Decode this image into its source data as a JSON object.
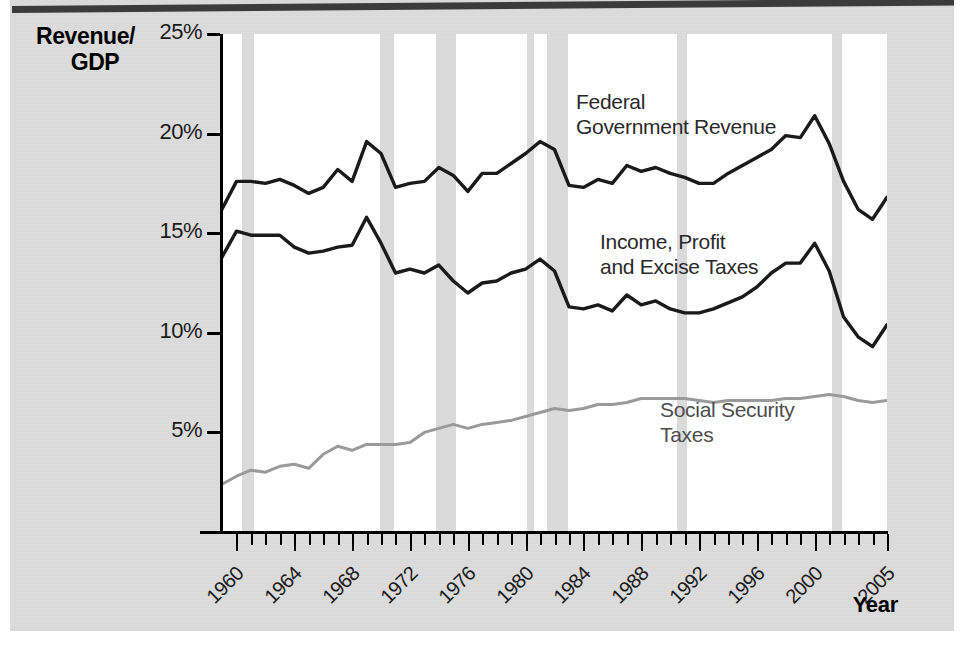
{
  "axis": {
    "y_title_line1": "Revenue/",
    "y_title_line2": "GDP",
    "x_title": "Year",
    "y_ticks": [
      "5%",
      "10%",
      "15%",
      "20%",
      "25%"
    ],
    "x_ticks": [
      "1960",
      "1964",
      "1968",
      "1972",
      "1976",
      "1980",
      "1984",
      "1988",
      "1992",
      "1996",
      "2000",
      "2005"
    ]
  },
  "annotations": {
    "federal": "Federal\nGovernment Revenue",
    "income": "Income, Profit\nand Excise Taxes",
    "social_security": "Social Security\nTaxes"
  },
  "colors": {
    "dark_line": "#1a1a1a",
    "gray_line": "#9a9a9a",
    "recession_band": "#dadada",
    "paper": "#dcdcdc",
    "plot_bg": "#ffffff"
  },
  "chart_data": {
    "type": "line",
    "title": "",
    "xlabel": "Year",
    "ylabel": "Revenue/GDP",
    "xlim": [
      1959,
      2005
    ],
    "ylim": [
      0,
      25
    ],
    "y_unit": "percent of GDP",
    "grid": false,
    "legend": "inline-annotations",
    "x": [
      1959,
      1960,
      1961,
      1962,
      1963,
      1964,
      1965,
      1966,
      1967,
      1968,
      1969,
      1970,
      1971,
      1972,
      1973,
      1974,
      1975,
      1976,
      1977,
      1978,
      1979,
      1980,
      1981,
      1982,
      1983,
      1984,
      1985,
      1986,
      1987,
      1988,
      1989,
      1990,
      1991,
      1992,
      1993,
      1994,
      1995,
      1996,
      1997,
      1998,
      1999,
      2000,
      2001,
      2002,
      2003,
      2004,
      2005
    ],
    "series": [
      {
        "name": "Federal Government Revenue",
        "color": "#1a1a1a",
        "values": [
          16.2,
          17.6,
          17.6,
          17.5,
          17.7,
          17.4,
          17.0,
          17.3,
          18.2,
          17.6,
          19.6,
          19.0,
          17.3,
          17.5,
          17.6,
          18.3,
          17.9,
          17.1,
          18.0,
          18.0,
          18.5,
          19.0,
          19.6,
          19.2,
          17.4,
          17.3,
          17.7,
          17.5,
          18.4,
          18.1,
          18.3,
          18.0,
          17.8,
          17.5,
          17.5,
          18.0,
          18.4,
          18.8,
          19.2,
          19.9,
          19.8,
          20.9,
          19.5,
          17.6,
          16.2,
          15.7,
          16.8
        ]
      },
      {
        "name": "Income, Profit and Excise Taxes",
        "color": "#1a1a1a",
        "values": [
          13.8,
          15.1,
          14.9,
          14.9,
          14.9,
          14.3,
          14.0,
          14.1,
          14.3,
          14.4,
          15.8,
          14.5,
          13.0,
          13.2,
          13.0,
          13.4,
          12.6,
          12.0,
          12.5,
          12.6,
          13.0,
          13.2,
          13.7,
          13.1,
          11.3,
          11.2,
          11.4,
          11.1,
          11.9,
          11.4,
          11.6,
          11.2,
          11.0,
          11.0,
          11.2,
          11.5,
          11.8,
          12.3,
          13.0,
          13.5,
          13.5,
          14.5,
          13.1,
          10.8,
          9.8,
          9.3,
          10.4
        ]
      },
      {
        "name": "Social Security Taxes",
        "color": "#9a9a9a",
        "values": [
          2.4,
          2.8,
          3.1,
          3.0,
          3.3,
          3.4,
          3.2,
          3.9,
          4.3,
          4.1,
          4.4,
          4.4,
          4.4,
          4.5,
          5.0,
          5.2,
          5.4,
          5.2,
          5.4,
          5.5,
          5.6,
          5.8,
          6.0,
          6.2,
          6.1,
          6.2,
          6.4,
          6.4,
          6.5,
          6.7,
          6.7,
          6.7,
          6.7,
          6.6,
          6.5,
          6.6,
          6.6,
          6.6,
          6.6,
          6.7,
          6.7,
          6.8,
          6.9,
          6.8,
          6.6,
          6.5,
          6.6
        ]
      }
    ],
    "recession_bands": [
      {
        "start": 1960.4,
        "end": 1961.2
      },
      {
        "start": 1969.9,
        "end": 1970.9
      },
      {
        "start": 1973.8,
        "end": 1975.2
      },
      {
        "start": 1980.1,
        "end": 1980.6
      },
      {
        "start": 1981.5,
        "end": 1982.9
      },
      {
        "start": 1990.5,
        "end": 1991.2
      },
      {
        "start": 2001.2,
        "end": 2001.9
      }
    ]
  }
}
